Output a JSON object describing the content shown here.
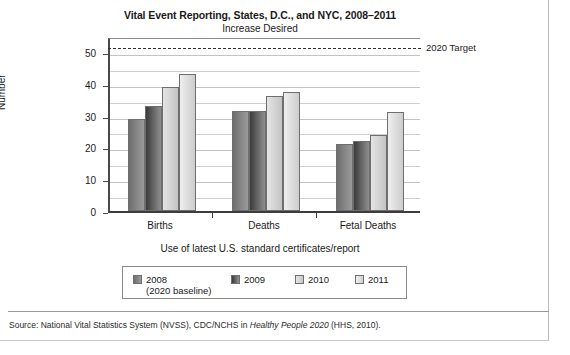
{
  "figure": {
    "title": "Vital Event Reporting, States, D.C., and NYC, 2008–2011",
    "subtitle": "Increase Desired",
    "source_prefix": "Source: National Vital Statistics System (NVSS), CDC/NCHS in ",
    "source_italic": "Healthy People 2020",
    "source_suffix": " (HHS, 2010)."
  },
  "chart_data": {
    "type": "bar",
    "title": "Vital Event Reporting, States, D.C., and NYC, 2008–2011",
    "subtitle": "Increase Desired",
    "xlabel": "Use of latest U.S. standard certificates/report",
    "ylabel": "Number",
    "ylim": [
      0,
      55
    ],
    "yticks": [
      0,
      10,
      20,
      30,
      40,
      50
    ],
    "ytick_labels": [
      "0",
      "10",
      "20",
      "30",
      "40",
      "50"
    ],
    "minor_gridlines": [
      5,
      15,
      25,
      35,
      45
    ],
    "grid": true,
    "legend_position": "below",
    "categories": [
      "Births",
      "Deaths",
      "Fetal Deaths"
    ],
    "series": [
      {
        "name": "2008",
        "sublabel": "(2020 baseline)",
        "values": [
          29,
          31.5,
          21
        ]
      },
      {
        "name": "2009",
        "sublabel": "",
        "values": [
          33,
          31.5,
          22
        ]
      },
      {
        "name": "2010",
        "sublabel": "",
        "values": [
          39,
          36,
          24
        ]
      },
      {
        "name": "2011",
        "sublabel": "",
        "values": [
          43,
          37.5,
          31
        ]
      }
    ],
    "annotations": [
      {
        "label": "2020 Target",
        "value": 52,
        "style": "dashed-line"
      }
    ]
  }
}
